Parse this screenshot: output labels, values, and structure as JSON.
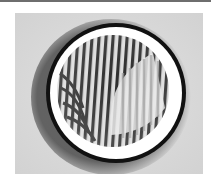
{
  "image": {
    "description": "Grayscale micrograph of a circular domain with a dark outer ring, a bright inner rim, and a striped (fingerprint-like) interior pattern with a lighter crescent region on the right",
    "colors": {
      "background": "#d9d9d9",
      "ring": "#111111",
      "rim": "#ffffff",
      "stripe_dark": "#2a2a2a",
      "stripe_light": "#e6e6e6"
    }
  }
}
